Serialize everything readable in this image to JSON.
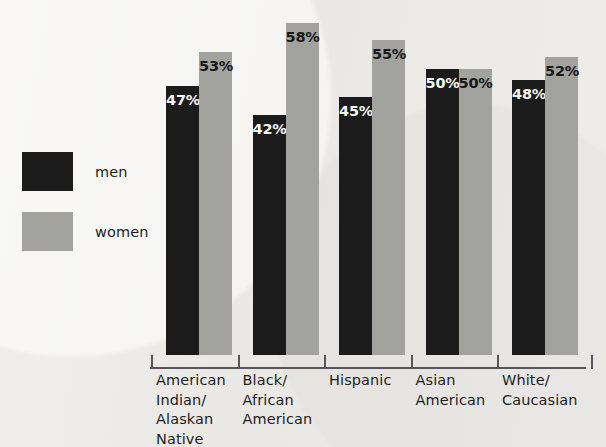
{
  "chart_data": {
    "type": "bar",
    "title": "",
    "subtitle": "",
    "xlabel": "",
    "ylabel": "",
    "ylim": [
      0,
      62
    ],
    "grid": false,
    "legend_position": "left",
    "value_suffix": "%",
    "categories": [
      "American Indian/ Alaskan Native",
      "Black/ African American",
      "Hispanic",
      "Asian American",
      "White/ Caucasian"
    ],
    "category_lines": [
      [
        "American",
        "Indian/",
        "Alaskan",
        "Native"
      ],
      [
        "Black/",
        "African",
        "American"
      ],
      [
        "Hispanic"
      ],
      [
        "Asian",
        "American"
      ],
      [
        "White/",
        "Caucasian"
      ]
    ],
    "series": [
      {
        "name": "men",
        "color": "#1b1b1b",
        "values": [
          47,
          42,
          45,
          50,
          48
        ],
        "labels": [
          "47%",
          "42%",
          "45%",
          "50%",
          "48%"
        ]
      },
      {
        "name": "women",
        "color": "#a2a29f",
        "values": [
          53,
          58,
          55,
          50,
          52
        ],
        "labels": [
          "53%",
          "58%",
          "55%",
          "50%",
          "52%"
        ]
      }
    ]
  },
  "legend": {
    "items": [
      {
        "label": "men",
        "color": "#1b1b1b"
      },
      {
        "label": "women",
        "color": "#a2a29f"
      }
    ]
  },
  "colors": {
    "background": "#ebeae7",
    "men_bar": "#1b1b1b",
    "women_bar": "#a2a29f",
    "axis": "#56565a",
    "text": "#1d1d1d",
    "men_value_text": "#f6f6f4",
    "women_value_text": "#17171a"
  }
}
